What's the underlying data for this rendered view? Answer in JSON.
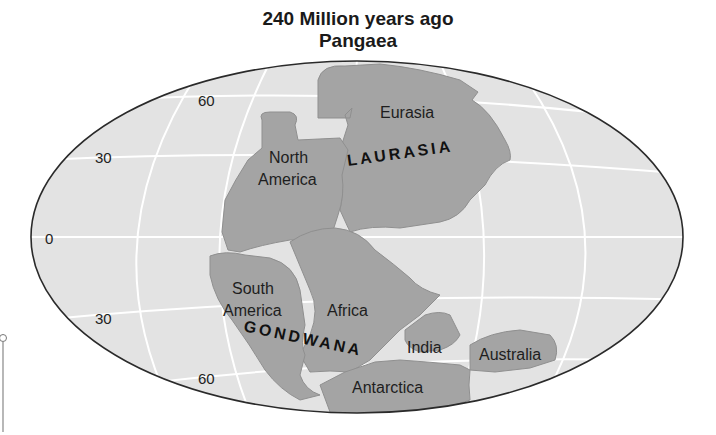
{
  "title": {
    "line1": "240 Million years ago",
    "line2": "Pangaea"
  },
  "latitude_labels": {
    "n60": "60",
    "n30": "30",
    "eq": "0",
    "s30": "30",
    "s60": "60"
  },
  "supercontinents": {
    "north": "LAURASIA",
    "south": "GONDWANA"
  },
  "continents": {
    "eurasia": "Eurasia",
    "north_america_1": "North",
    "north_america_2": "America",
    "south_america_1": "South",
    "south_america_2": "America",
    "africa": "Africa",
    "india": "India",
    "australia": "Australia",
    "antarctica": "Antarctica"
  },
  "colors": {
    "ocean": "#e3e3e3",
    "land": "#a4a4a4",
    "grid": "#ffffff",
    "outline": "#2a2a2a"
  }
}
